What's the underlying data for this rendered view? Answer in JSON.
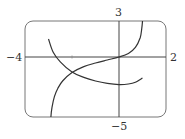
{
  "chart_data": {
    "type": "line",
    "title": "",
    "xlabel": "",
    "ylabel": "",
    "xlim": [
      -4,
      2
    ],
    "ylim": [
      -5,
      3
    ],
    "grid": false,
    "legend": null,
    "tick_labels": {
      "x_min": "−4",
      "x_max": "2",
      "y_max": "3",
      "y_min": "−5"
    },
    "series": [
      {
        "name": "increasing curve",
        "x": [
          -2.9,
          -2.85,
          -2.75,
          -2.6,
          -2.4,
          -2.0,
          -1.5,
          -1.0,
          -0.5,
          0.0,
          0.4,
          0.7,
          0.9,
          0.97,
          1.0
        ],
        "y": [
          -5.0,
          -4.2,
          -3.3,
          -2.6,
          -2.0,
          -1.3,
          -0.8,
          -0.5,
          -0.25,
          0.0,
          0.3,
          0.8,
          1.6,
          2.4,
          3.0
        ]
      },
      {
        "name": "U-shaped curve",
        "x": [
          -3.0,
          -2.8,
          -2.5,
          -2.0,
          -1.5,
          -1.0,
          -0.5,
          0.0,
          0.4,
          0.7,
          1.0
        ],
        "y": [
          1.5,
          0.4,
          -0.4,
          -1.25,
          -1.7,
          -2.0,
          -2.2,
          -2.3,
          -2.25,
          -2.1,
          -1.75
        ]
      }
    ]
  }
}
